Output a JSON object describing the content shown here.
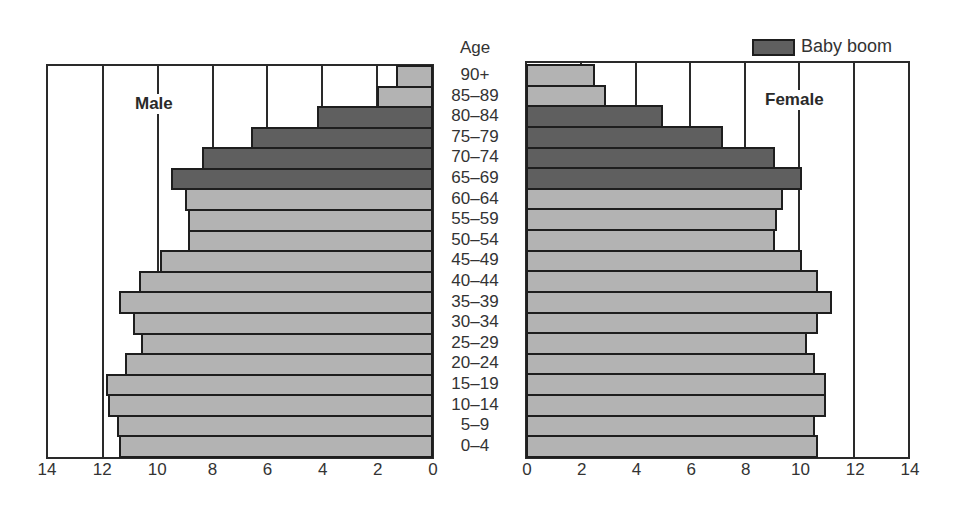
{
  "chart_data": {
    "type": "bar",
    "subtype": "population-pyramid",
    "title": "",
    "center_axis_title": "Age",
    "categories": [
      "90+",
      "85–89",
      "80–84",
      "75–79",
      "70–74",
      "65–69",
      "60–64",
      "55–59",
      "50–54",
      "45–49",
      "40–44",
      "35–39",
      "30–34",
      "25–29",
      "20–24",
      "15–19",
      "10–14",
      "5–9",
      "0–4"
    ],
    "series": [
      {
        "name": "Male",
        "label": "Male",
        "values": [
          1.3,
          2.0,
          4.2,
          6.6,
          8.4,
          9.5,
          9.0,
          8.9,
          8.9,
          9.9,
          10.7,
          11.4,
          10.9,
          10.6,
          11.2,
          11.9,
          11.8,
          11.5,
          11.4
        ]
      },
      {
        "name": "Female",
        "label": "Female",
        "values": [
          2.5,
          2.9,
          5.0,
          7.2,
          9.1,
          10.1,
          9.4,
          9.2,
          9.1,
          10.1,
          10.7,
          11.2,
          10.7,
          10.3,
          10.6,
          11.0,
          11.0,
          10.6,
          10.7
        ]
      }
    ],
    "highlight": {
      "name": "Baby boom",
      "categories": [
        "80–84",
        "75–79",
        "70–74",
        "65–69"
      ]
    },
    "xlim": [
      0,
      14
    ],
    "male_axis_ticks": [
      "14",
      "12",
      "10",
      "8",
      "6",
      "4",
      "2",
      "0"
    ],
    "female_axis_ticks": [
      "0",
      "2",
      "4",
      "6",
      "8",
      "10",
      "12",
      "14"
    ],
    "grid": true,
    "legend": {
      "position": "top-right",
      "entries": [
        "Baby boom"
      ]
    },
    "colors": {
      "normal": "#b3b3b3",
      "baby_boom": "#5f5f5f",
      "outline": "#1e1e1e"
    }
  },
  "labels": {
    "age_title": "Age",
    "male": "Male",
    "female": "Female",
    "legend": "Baby boom"
  }
}
